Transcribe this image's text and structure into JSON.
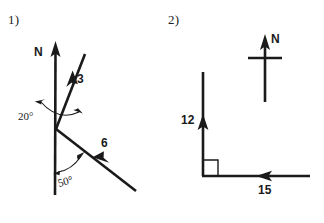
{
  "page": {
    "background_color": "#ffffff",
    "ink_color": "#1a1a1a",
    "width": 324,
    "height": 223
  },
  "problems": [
    {
      "number_label": "1)",
      "description": "Vector diagram with north reference line and two bearing vectors",
      "north_label": "N",
      "vectors": [
        {
          "magnitude_label": "3",
          "direction": "up-right"
        },
        {
          "magnitude_label": "6",
          "direction": "up-left"
        }
      ],
      "angles": [
        {
          "value": "20",
          "degree_symbol": "°",
          "text": "20°"
        },
        {
          "value": "50",
          "degree_symbol": "°",
          "text": "50°"
        }
      ]
    },
    {
      "number_label": "2)",
      "description": "Right-angle vector diagram with vertical and horizontal components and a north compass marker",
      "north_label": "N",
      "vectors": [
        {
          "magnitude_label": "12",
          "direction": "up"
        },
        {
          "magnitude_label": "15",
          "direction": "left"
        }
      ],
      "right_angle_marker": true
    }
  ]
}
